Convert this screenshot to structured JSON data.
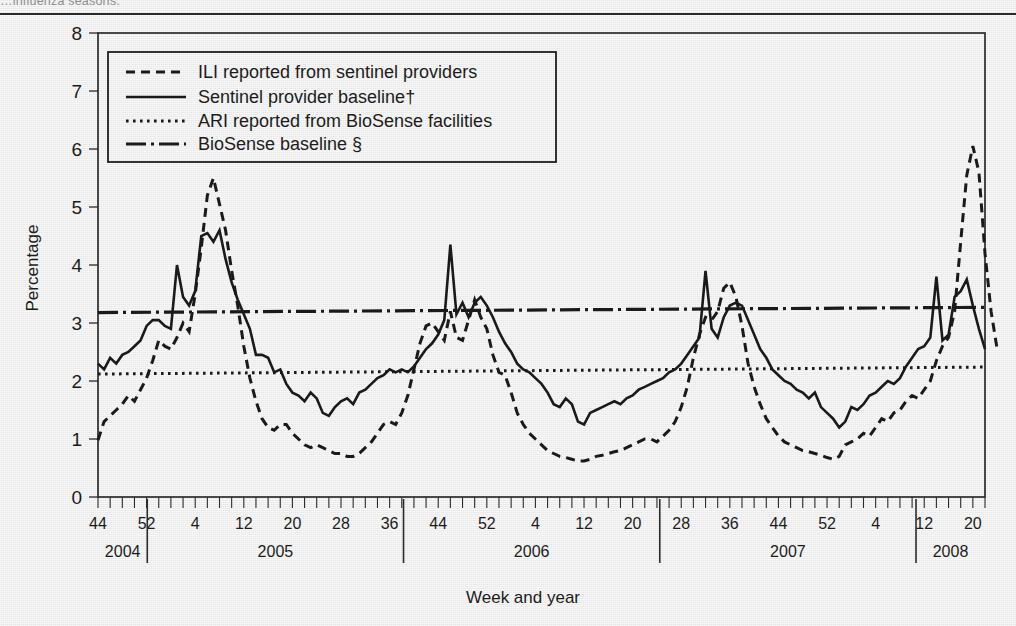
{
  "top_caption": "…influenza seasons.",
  "chart_data": {
    "type": "line",
    "title": "",
    "xlabel": "Week and year",
    "ylabel": "Percentage",
    "ylim": [
      0,
      8
    ],
    "yticks": [
      0,
      1,
      2,
      3,
      4,
      5,
      6,
      7,
      8
    ],
    "grid": false,
    "legend_position": "top-left-inside",
    "x_axis": {
      "tick_unit": "week",
      "minor_tick_every": 2,
      "labeled_weeks": [
        "44",
        "52",
        "4",
        "12",
        "20",
        "28",
        "36",
        "44",
        "52",
        "4",
        "12",
        "20",
        "28",
        "36",
        "44",
        "52",
        "4",
        "12",
        "20",
        "28",
        "36",
        "44",
        "52",
        "4",
        "12"
      ],
      "year_groups": [
        {
          "label": "2004",
          "weeks_from": 44,
          "weeks_to": 53
        },
        {
          "label": "2005",
          "weeks_from": 1,
          "weeks_to": 52
        },
        {
          "label": "2006",
          "weeks_from": 1,
          "weeks_to": 52
        },
        {
          "label": "2007",
          "weeks_from": 1,
          "weeks_to": 52
        },
        {
          "label": "2008",
          "weeks_from": 1,
          "weeks_to": 14
        }
      ],
      "start": "2004 week 44",
      "end": "2008 week 14"
    },
    "legend": [
      {
        "label": "ILI reported from sentinel providers",
        "style": "dashed"
      },
      {
        "label": "Sentinel provider baseline†",
        "style": "solid"
      },
      {
        "label": "ARI reported from BioSense facilities",
        "style": "dotted"
      },
      {
        "label": "BioSense baseline §",
        "style": "dash-dot"
      }
    ],
    "series": [
      {
        "name": "ARI reported from BioSense facilities",
        "style": "solid",
        "values": [
          2.3,
          2.2,
          2.4,
          2.3,
          2.45,
          2.5,
          2.6,
          2.7,
          2.95,
          3.05,
          3.05,
          2.95,
          2.9,
          4.0,
          3.45,
          3.3,
          3.55,
          4.5,
          4.55,
          4.4,
          4.6,
          4.1,
          3.7,
          3.4,
          3.15,
          2.9,
          2.45,
          2.45,
          2.4,
          2.15,
          2.2,
          1.95,
          1.8,
          1.75,
          1.65,
          1.8,
          1.7,
          1.45,
          1.4,
          1.55,
          1.65,
          1.7,
          1.6,
          1.8,
          1.85,
          1.95,
          2.05,
          2.1,
          2.2,
          2.15,
          2.2,
          2.15,
          2.25,
          2.4,
          2.55,
          2.65,
          2.8,
          3.05,
          4.35,
          3.15,
          3.35,
          3.1,
          3.35,
          3.45,
          3.3,
          3.1,
          2.85,
          2.65,
          2.5,
          2.3,
          2.2,
          2.15,
          2.05,
          1.95,
          1.8,
          1.6,
          1.55,
          1.7,
          1.6,
          1.3,
          1.25,
          1.45,
          1.5,
          1.55,
          1.6,
          1.65,
          1.6,
          1.7,
          1.75,
          1.85,
          1.9,
          1.95,
          2.0,
          2.05,
          2.15,
          2.2,
          2.3,
          2.45,
          2.6,
          2.75,
          3.9,
          2.9,
          2.75,
          3.1,
          3.3,
          3.35,
          3.3,
          3.05,
          2.8,
          2.55,
          2.4,
          2.2,
          2.1,
          2.0,
          1.95,
          1.85,
          1.8,
          1.7,
          1.8,
          1.55,
          1.45,
          1.35,
          1.2,
          1.3,
          1.55,
          1.5,
          1.6,
          1.75,
          1.8,
          1.9,
          2.0,
          1.95,
          2.05,
          2.25,
          2.4,
          2.55,
          2.6,
          2.75,
          3.8,
          2.7,
          2.8,
          3.45,
          3.55,
          3.75,
          3.3,
          2.9,
          2.55
        ]
      },
      {
        "name": "ILI reported from sentinel providers",
        "style": "dashed",
        "values": [
          0.98,
          1.3,
          1.4,
          1.5,
          1.6,
          1.75,
          1.65,
          1.85,
          2.05,
          2.35,
          2.7,
          2.6,
          2.55,
          2.75,
          3.0,
          2.85,
          3.5,
          4.3,
          5.2,
          5.5,
          5.05,
          4.6,
          3.9,
          3.3,
          2.6,
          2.05,
          1.65,
          1.35,
          1.2,
          1.15,
          1.25,
          1.25,
          1.1,
          1.0,
          0.9,
          0.85,
          0.9,
          0.85,
          0.8,
          0.75,
          0.75,
          0.7,
          0.7,
          0.75,
          0.85,
          0.95,
          1.1,
          1.25,
          1.3,
          1.25,
          1.45,
          1.75,
          2.2,
          2.65,
          2.95,
          3.0,
          2.85,
          2.7,
          3.2,
          2.75,
          2.7,
          3.05,
          3.4,
          3.1,
          2.9,
          2.45,
          2.15,
          2.1,
          1.8,
          1.45,
          1.25,
          1.1,
          1.0,
          0.9,
          0.8,
          0.75,
          0.7,
          0.68,
          0.65,
          0.62,
          0.62,
          0.65,
          0.7,
          0.72,
          0.75,
          0.78,
          0.8,
          0.85,
          0.9,
          0.95,
          1.0,
          1.0,
          0.95,
          1.05,
          1.15,
          1.3,
          1.55,
          1.9,
          2.4,
          2.8,
          3.1,
          3.05,
          3.2,
          3.6,
          3.7,
          3.45,
          2.95,
          2.3,
          1.9,
          1.6,
          1.35,
          1.2,
          1.05,
          0.95,
          0.9,
          0.85,
          0.8,
          0.78,
          0.75,
          0.72,
          0.68,
          0.65,
          0.7,
          0.9,
          0.95,
          1.0,
          1.1,
          1.05,
          1.2,
          1.35,
          1.3,
          1.45,
          1.5,
          1.65,
          1.75,
          1.7,
          1.85,
          2.0,
          2.35,
          2.6,
          2.75,
          3.2,
          4.4,
          5.55,
          6.05,
          5.6,
          4.2,
          3.2,
          2.55
        ]
      }
    ],
    "baselines": [
      {
        "name": "BioSense baseline §",
        "style": "dash-dot",
        "value_start": 3.18,
        "value_end": 3.27
      },
      {
        "name": "ARI BioSense dotted reference",
        "style": "dotted",
        "value_start": 2.12,
        "value_end": 2.24
      }
    ]
  }
}
